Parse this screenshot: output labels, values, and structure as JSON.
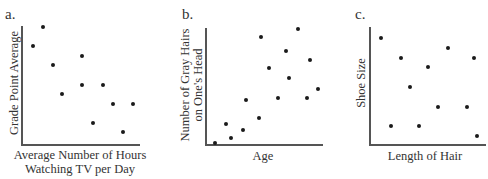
{
  "chart_data": [
    {
      "type": "scatter",
      "panel_label": "a.",
      "title": "",
      "xlabel": "Average Number of Hours Watching TV per Day",
      "xlabel_lines": [
        "Average Number of Hours",
        "Watching TV per Day"
      ],
      "ylabel": "Grade Point Average",
      "ylabel_lines": [
        "Grade Point Average"
      ],
      "grid": false,
      "ticks": false,
      "xlim": [
        0,
        10
      ],
      "ylim": [
        0,
        10
      ],
      "points": [
        {
          "x": 0.9,
          "y": 8.5
        },
        {
          "x": 1.8,
          "y": 10.2
        },
        {
          "x": 2.6,
          "y": 6.8
        },
        {
          "x": 3.4,
          "y": 4.1
        },
        {
          "x": 5.1,
          "y": 7.6
        },
        {
          "x": 5.1,
          "y": 5.0
        },
        {
          "x": 6.9,
          "y": 5.0
        },
        {
          "x": 6.0,
          "y": 1.5
        },
        {
          "x": 7.7,
          "y": 3.2
        },
        {
          "x": 9.4,
          "y": 3.2
        },
        {
          "x": 8.6,
          "y": 0.7
        }
      ],
      "trend": "negative"
    },
    {
      "type": "scatter",
      "panel_label": "b.",
      "title": "",
      "xlabel": "Age",
      "xlabel_lines": [
        "Age"
      ],
      "ylabel": "Number of Gray Hairs on One's Head",
      "ylabel_lines": [
        "Number of Gray Hairs",
        "on One's Head"
      ],
      "grid": false,
      "ticks": false,
      "xlim": [
        0,
        10
      ],
      "ylim": [
        0,
        10
      ],
      "points": [
        {
          "x": 0.4,
          "y": 0.1
        },
        {
          "x": 1.4,
          "y": 1.7
        },
        {
          "x": 1.9,
          "y": 0.5
        },
        {
          "x": 3.0,
          "y": 1.2
        },
        {
          "x": 3.3,
          "y": 3.8
        },
        {
          "x": 4.6,
          "y": 2.3
        },
        {
          "x": 4.8,
          "y": 9.3
        },
        {
          "x": 5.5,
          "y": 6.6
        },
        {
          "x": 6.4,
          "y": 4.0
        },
        {
          "x": 7.1,
          "y": 8.1
        },
        {
          "x": 7.4,
          "y": 5.7
        },
        {
          "x": 8.3,
          "y": 10.0
        },
        {
          "x": 9.1,
          "y": 4.0
        },
        {
          "x": 9.4,
          "y": 7.3
        },
        {
          "x": 10.2,
          "y": 4.8
        }
      ],
      "trend": "positive"
    },
    {
      "type": "scatter",
      "panel_label": "c.",
      "title": "",
      "xlabel": "Length of Hair",
      "xlabel_lines": [
        "Length of Hair"
      ],
      "ylabel": "Shoe Size",
      "ylabel_lines": [
        "Shoe Size"
      ],
      "grid": false,
      "ticks": false,
      "xlim": [
        0,
        10
      ],
      "ylim": [
        0,
        10
      ],
      "points": [
        {
          "x": 0.9,
          "y": 9.2
        },
        {
          "x": 2.7,
          "y": 7.5
        },
        {
          "x": 7.0,
          "y": 8.4
        },
        {
          "x": 9.4,
          "y": 7.5
        },
        {
          "x": 5.2,
          "y": 6.7
        },
        {
          "x": 3.5,
          "y": 5.0
        },
        {
          "x": 6.1,
          "y": 3.3
        },
        {
          "x": 8.7,
          "y": 3.3
        },
        {
          "x": 1.8,
          "y": 1.6
        },
        {
          "x": 4.4,
          "y": 1.6
        },
        {
          "x": 9.6,
          "y": 0.8
        }
      ],
      "trend": "none"
    }
  ]
}
